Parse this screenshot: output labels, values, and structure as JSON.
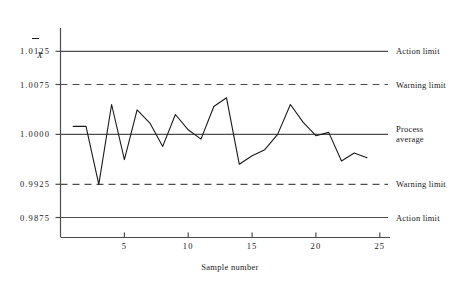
{
  "chart_data": {
    "type": "line",
    "title": "",
    "subtitle": "",
    "xlabel": "Sample number",
    "ylabel": "X̄",
    "ylabel_plain": "X-bar",
    "x": [
      1,
      2,
      3,
      4,
      5,
      6,
      7,
      8,
      9,
      10,
      11,
      12,
      13,
      14,
      15,
      16,
      17,
      18,
      19,
      20,
      21,
      22,
      23,
      24
    ],
    "values": [
      1.0012,
      1.0012,
      0.9925,
      1.0045,
      0.9962,
      1.0037,
      1.0017,
      0.9982,
      1.003,
      1.0007,
      0.9993,
      1.0042,
      1.0055,
      0.9955,
      0.9968,
      0.9977,
      1.0,
      1.0045,
      1.0018,
      0.9998,
      1.0003,
      0.996,
      0.9972,
      0.9965
    ],
    "series": [
      {
        "name": "Sample mean",
        "values": [
          1.0012,
          1.0012,
          0.9925,
          1.0045,
          0.9962,
          1.0037,
          1.0017,
          0.9982,
          1.003,
          1.0007,
          0.9993,
          1.0042,
          1.0055,
          0.9955,
          0.9968,
          0.9977,
          1.0,
          1.0045,
          1.0018,
          0.9998,
          1.0003,
          0.996,
          0.9972,
          0.9965
        ]
      }
    ],
    "xlim": [
      0,
      25.8
    ],
    "ylim": [
      0.9845,
      1.016
    ],
    "xticks": [
      5,
      10,
      15,
      20,
      25
    ],
    "xtick_labels": [
      "5",
      "10",
      "15",
      "20",
      "25"
    ],
    "yticks": [
      1.0125,
      1.0075,
      1.0,
      0.9925,
      0.9875
    ],
    "ytick_labels": [
      "1.0125",
      "1.0075",
      "1.0000",
      "0.9925",
      "0.9875"
    ],
    "grid": false,
    "legend_position": "right-inline",
    "reference_lines": [
      {
        "id": "upper-action-limit",
        "value": 1.0125,
        "label": "Action limit",
        "style": "solid"
      },
      {
        "id": "upper-warning-limit",
        "value": 1.0075,
        "label": "Warning limit",
        "style": "dashed"
      },
      {
        "id": "process-average",
        "value": 1.0,
        "label": "Process average",
        "label_line1": "Process",
        "label_line2": "average",
        "style": "solid"
      },
      {
        "id": "lower-warning-limit",
        "value": 0.9925,
        "label": "Warning limit",
        "style": "dashed"
      },
      {
        "id": "lower-action-limit",
        "value": 0.9875,
        "label": "Action limit",
        "style": "solid"
      }
    ],
    "colors": {
      "series_line": "#1a1a1a",
      "reference_line": "#4d4d4d",
      "axis": "#4d4d4d",
      "text": "#1a1a1a",
      "background": "#ffffff"
    }
  }
}
